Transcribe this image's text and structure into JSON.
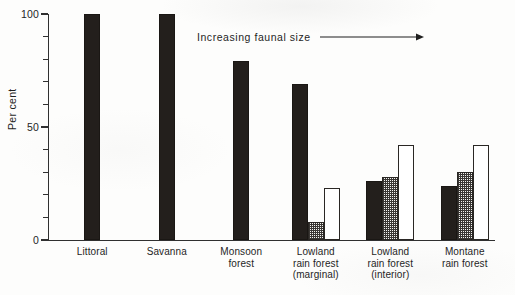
{
  "chart_data": {
    "type": "bar",
    "title": "",
    "subtitle": "",
    "xlabel": "",
    "ylabel": "Per cent",
    "ylim": [
      0,
      100
    ],
    "yticks": [
      0,
      10,
      20,
      30,
      40,
      50,
      60,
      70,
      80,
      90,
      100
    ],
    "ytick_labels_shown": [
      "0",
      "50",
      "100"
    ],
    "grid": false,
    "legend": "none",
    "categories": [
      "Littoral",
      "Savanna",
      "Monsoon\nforest",
      "Lowland\nrain forest\n(marginal)",
      "Lowland\nrain forest\n(interior)",
      "Montane\nrain forest"
    ],
    "series": [
      {
        "name": "small faunal size",
        "fill": "solid-black",
        "color": "#231f1c",
        "values": [
          100,
          100,
          79,
          69,
          26,
          24
        ]
      },
      {
        "name": "medium faunal size",
        "fill": "stippled",
        "color": "#f4f4f2",
        "values": [
          null,
          null,
          null,
          8,
          28,
          30
        ]
      },
      {
        "name": "large faunal size",
        "fill": "open-white",
        "color": "#ffffff",
        "values": [
          null,
          null,
          null,
          23,
          42,
          42
        ]
      }
    ],
    "annotations": [
      {
        "text": "Increasing faunal size",
        "arrow": "right-arrow-icon",
        "position": "upper-middle"
      }
    ]
  },
  "axis": {
    "y_title": "Per cent",
    "tick_labels": [
      {
        "value": 100,
        "label": "100",
        "major": true
      },
      {
        "value": 90,
        "label": "",
        "major": false
      },
      {
        "value": 80,
        "label": "",
        "major": false
      },
      {
        "value": 70,
        "label": "",
        "major": false
      },
      {
        "value": 60,
        "label": "",
        "major": false
      },
      {
        "value": 50,
        "label": "50",
        "major": true
      },
      {
        "value": 40,
        "label": "",
        "major": false
      },
      {
        "value": 30,
        "label": "",
        "major": false
      },
      {
        "value": 20,
        "label": "",
        "major": false
      },
      {
        "value": 10,
        "label": "",
        "major": false
      },
      {
        "value": 0,
        "label": "0",
        "major": true
      }
    ]
  },
  "annotation": {
    "text": "Increasing faunal size"
  }
}
